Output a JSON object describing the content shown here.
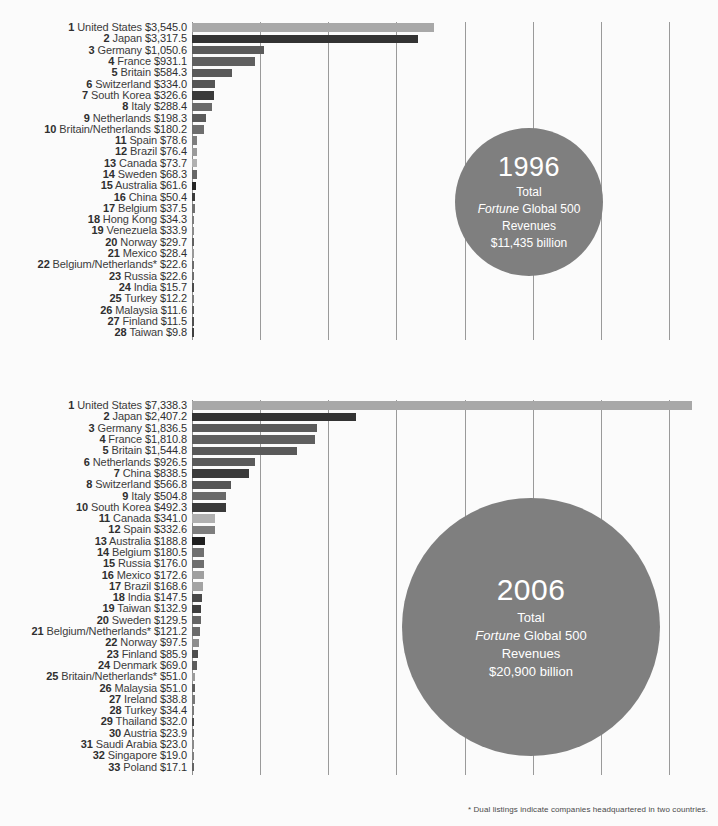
{
  "footnote": "* Dual listings indicate companies headquartered in two countries.",
  "chart_data": [
    {
      "type": "bar",
      "title": "1996",
      "orientation": "horizontal",
      "xlabel": "",
      "ylabel": "",
      "grid": true,
      "axis_max": 7500,
      "gridline_step": 1000,
      "center_label": {
        "year": "1996",
        "line1": "Total",
        "line2_italic": "Fortune",
        "line2_rest": " Global 500",
        "line3": "Revenues",
        "line4": "$11,435 billion"
      },
      "categories": [
        "United States",
        "Japan",
        "Germany",
        "France",
        "Britain",
        "Switzerland",
        "South Korea",
        "Italy",
        "Netherlands",
        "Britain/Netherlands",
        "Spain",
        "Brazil",
        "Canada",
        "Sweden",
        "Australia",
        "China",
        "Belgium",
        "Hong Kong",
        "Venezuela",
        "Norway",
        "Mexico",
        "Belgium/Netherlands*",
        "Russia",
        "India",
        "Turkey",
        "Malaysia",
        "Finland",
        "Taiwan"
      ],
      "values": [
        3545.0,
        3317.5,
        1050.6,
        931.1,
        584.3,
        334.0,
        326.6,
        288.4,
        198.3,
        180.2,
        78.6,
        76.4,
        73.7,
        68.3,
        61.6,
        50.4,
        37.5,
        34.3,
        33.9,
        29.7,
        28.4,
        22.6,
        22.6,
        15.7,
        12.2,
        11.6,
        11.5,
        9.8
      ],
      "value_labels": [
        "$3,545.0",
        "$3,317.5",
        "$1,050.6",
        "$931.1",
        "$584.3",
        "$334.0",
        "$326.6",
        "$288.4",
        "$198.3",
        "$180.2",
        "$78.6",
        "$76.4",
        "$73.7",
        "$68.3",
        "$61.6",
        "$50.4",
        "$37.5",
        "$34.3",
        "$33.9",
        "$29.7",
        "$28.4",
        "$22.6",
        "$22.6",
        "$15.7",
        "$12.2",
        "$11.6",
        "$11.5",
        "$9.8"
      ],
      "ranks": [
        1,
        2,
        3,
        4,
        5,
        6,
        7,
        8,
        9,
        10,
        11,
        12,
        13,
        14,
        15,
        16,
        17,
        18,
        19,
        20,
        21,
        22,
        23,
        24,
        25,
        26,
        27,
        28
      ],
      "colors": [
        "#a8a8a8",
        "#333333",
        "#5b5b5b",
        "#5f5f5f",
        "#595959",
        "#555555",
        "#3a3a3a",
        "#6a6a6a",
        "#5a5a5a",
        "#6e6e6e",
        "#7e7e7e",
        "#9a9a9a",
        "#b0b0b0",
        "#666666",
        "#252525",
        "#3a3a3a",
        "#707070",
        "#7d7d7d",
        "#8a8a8a",
        "#606060",
        "#999999",
        "#6b6b6b",
        "#6e6e6e",
        "#4a4a4a",
        "#7a7a7a",
        "#5d5d5d",
        "#4e4e4e",
        "#3f3f3f"
      ]
    },
    {
      "type": "bar",
      "title": "2006",
      "orientation": "horizontal",
      "xlabel": "",
      "ylabel": "",
      "grid": true,
      "axis_max": 7500,
      "gridline_step": 1000,
      "center_label": {
        "year": "2006",
        "line1": "Total",
        "line2_italic": "Fortune",
        "line2_rest": " Global 500",
        "line3": "Revenues",
        "line4": "$20,900 billion"
      },
      "categories": [
        "United States",
        "Japan",
        "Germany",
        "France",
        "Britain",
        "Netherlands",
        "China",
        "Switzerland",
        "Italy",
        "South Korea",
        "Canada",
        "Spain",
        "Australia",
        "Belgium",
        "Russia",
        "Mexico",
        "Brazil",
        "India",
        "Taiwan",
        "Sweden",
        "Belgium/Netherlands*",
        "Norway",
        "Finland",
        "Denmark",
        "Britain/Netherlands*",
        "Malaysia",
        "Ireland",
        "Turkey",
        "Thailand",
        "Austria",
        "Saudi Arabia",
        "Singapore",
        "Poland"
      ],
      "values": [
        7338.3,
        2407.2,
        1836.5,
        1810.8,
        1544.8,
        926.5,
        838.5,
        566.8,
        504.8,
        492.3,
        341.0,
        332.6,
        188.8,
        180.5,
        176.0,
        172.6,
        168.6,
        147.5,
        132.9,
        129.5,
        121.2,
        97.5,
        85.9,
        69.0,
        51.0,
        51.0,
        38.8,
        34.4,
        32.0,
        23.9,
        23.0,
        19.0,
        17.1
      ],
      "value_labels": [
        "$7,338.3",
        "$2,407.2",
        "$1,836.5",
        "$1,810.8",
        "$1,544.8",
        "$926.5",
        "$838.5",
        "$566.8",
        "$504.8",
        "$492.3",
        "$341.0",
        "$332.6",
        "$188.8",
        "$180.5",
        "$176.0",
        "$172.6",
        "$168.6",
        "$147.5",
        "$132.9",
        "$129.5",
        "$121.2",
        "$97.5",
        "$85.9",
        "$69.0",
        "$51.0",
        "$51.0",
        "$38.8",
        "$34.4",
        "$32.0",
        "$23.9",
        "$23.0",
        "$19.0",
        "$17.1"
      ],
      "ranks": [
        1,
        2,
        3,
        4,
        5,
        6,
        7,
        8,
        9,
        10,
        11,
        12,
        13,
        14,
        15,
        16,
        17,
        18,
        19,
        20,
        21,
        22,
        23,
        24,
        25,
        26,
        27,
        28,
        29,
        30,
        31,
        32,
        33
      ],
      "colors": [
        "#a8a8a8",
        "#333333",
        "#5b5b5b",
        "#5f5f5f",
        "#595959",
        "#5a5a5a",
        "#3a3a3a",
        "#555555",
        "#6a6a6a",
        "#3a3a3a",
        "#b0b0b0",
        "#7e7e7e",
        "#1f1f1f",
        "#707070",
        "#6e6e6e",
        "#9f9f9f",
        "#a3a3a3",
        "#4a4a4a",
        "#3f3f3f",
        "#666666",
        "#6b6b6b",
        "#8d8d8d",
        "#4e4e4e",
        "#5c5c5c",
        "#9b9b9b",
        "#5d5d5d",
        "#787878",
        "#7a7a7a",
        "#4c4c4c",
        "#6d6d6d",
        "#8a8a8a",
        "#7f7f7f",
        "#636363"
      ]
    }
  ]
}
